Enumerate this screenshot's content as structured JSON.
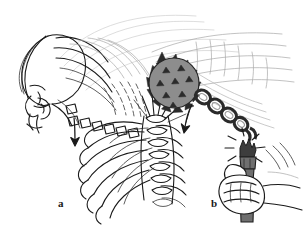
{
  "figure": {
    "caption_labels": [
      {
        "id": "a",
        "text": "a",
        "x": 58,
        "y": 198,
        "describes": "head, neck and thoracic spine with ribs in profile"
      },
      {
        "id": "b",
        "text": "b",
        "x": 211,
        "y": 198,
        "describes": "hand gripping broken flail handle"
      }
    ],
    "background_color": "#ffffff",
    "ink_color": "#1a1a1a",
    "ghost_line_color": "#b9b9b9",
    "mid_gray": "#8a8a8a",
    "dark_gray": "#4a4a4a",
    "panels": [
      {
        "id": "a",
        "name": "spine-panel",
        "elements": [
          "head-profile",
          "face-and-nose",
          "cervical-spine",
          "thoracic-vertebrae",
          "rib-cage",
          "radiating-motion-lines",
          "downward-arrow"
        ]
      },
      {
        "id": "b",
        "name": "flail-panel",
        "elements": [
          "spiked-ball",
          "chain-links",
          "broken-handle",
          "impact-burst-lines",
          "gripping-fist",
          "motion-streaks",
          "curved-arrow"
        ]
      }
    ],
    "arrows": [
      {
        "name": "spine-arrow",
        "direction": "down",
        "x": 76,
        "y": 133
      },
      {
        "name": "chain-arrow",
        "direction": "down-left",
        "x": 190,
        "y": 112
      }
    ]
  }
}
